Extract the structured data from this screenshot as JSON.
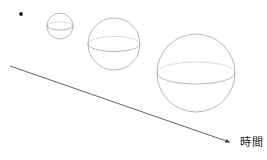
{
  "figure": {
    "title": "",
    "background_color": "#ffffff",
    "stroke_color": "#9a9a9a",
    "axis_color": "#3c3c3c",
    "text_color": "#1a1a1a",
    "width": 267,
    "height": 160
  },
  "axis": {
    "label": "時間",
    "label_reading": "jikan",
    "label_x": 240,
    "label_y": 137,
    "arrow": {
      "name": "time-axis-arrow",
      "x1": 10,
      "y1": 66,
      "x2": 232,
      "y2": 143,
      "direction": "right-down",
      "has_arrowhead": true
    }
  },
  "stages": [
    {
      "name": "point-singularity",
      "type": "dot",
      "cx": 21,
      "cy": 14,
      "r": 1.9,
      "filled": true,
      "label": ""
    },
    {
      "name": "sphere-small",
      "type": "sphere",
      "cx": 60,
      "cy": 26,
      "r": 13,
      "equator_ry": 4.0,
      "label": ""
    },
    {
      "name": "sphere-medium",
      "type": "sphere",
      "cx": 114,
      "cy": 44,
      "r": 26,
      "equator_ry": 7.5,
      "label": ""
    },
    {
      "name": "sphere-large",
      "type": "sphere",
      "cx": 196,
      "cy": 73,
      "r": 39,
      "equator_ry": 11.0,
      "label": ""
    }
  ],
  "chart_data": {
    "type": "diagram",
    "title": "",
    "xlabel": "時間",
    "ylabel": "",
    "description_categories": [
      "point",
      "small sphere",
      "medium sphere",
      "large sphere"
    ],
    "radii": [
      1.9,
      13,
      26,
      39
    ],
    "legend": []
  }
}
